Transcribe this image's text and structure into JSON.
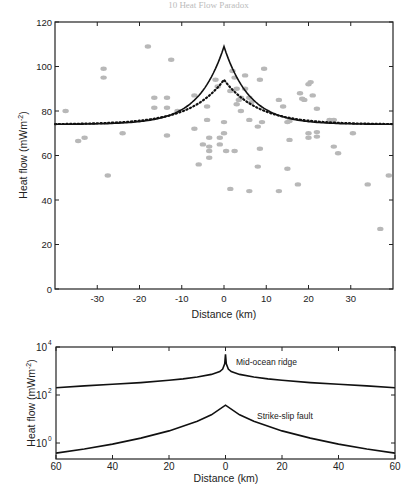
{
  "page": {
    "header": "10  Heat Flow Paradox"
  },
  "chart_data": [
    {
      "type": "scatter",
      "title": "",
      "xlabel": "Distance (km)",
      "ylabel": "Heat flow (mWm⁻²)",
      "xlim": [
        -40,
        40
      ],
      "ylim": [
        0,
        120
      ],
      "xticks": [
        -30,
        -20,
        -10,
        0,
        10,
        20,
        30
      ],
      "yticks": [
        0,
        20,
        40,
        60,
        80,
        100,
        120
      ],
      "grid": false,
      "legend": null,
      "series": [
        {
          "name": "Observed heat flow",
          "kind": "scatter",
          "color": "#b8b8b8",
          "points": [
            [
              -37.5,
              80
            ],
            [
              -34.5,
              66.5
            ],
            [
              -33,
              68
            ],
            [
              -28.5,
              99
            ],
            [
              -28.5,
              95
            ],
            [
              -27.5,
              51
            ],
            [
              -18,
              109
            ],
            [
              -12.5,
              103
            ],
            [
              -13.5,
              86
            ],
            [
              -13.5,
              81.5
            ],
            [
              -16.5,
              86
            ],
            [
              -16.5,
              81.5
            ],
            [
              -11,
              80
            ],
            [
              -13.5,
              69
            ],
            [
              -7,
              87
            ],
            [
              -4,
              82
            ],
            [
              -4,
              76
            ],
            [
              -3.5,
              68
            ],
            [
              -3.5,
              64
            ],
            [
              -3.5,
              62
            ],
            [
              -3.5,
              59
            ],
            [
              -5,
              65
            ],
            [
              -7,
              72
            ],
            [
              -6,
              56
            ],
            [
              -1,
              68
            ],
            [
              -1,
              65
            ],
            [
              -2,
              94
            ],
            [
              -1.5,
              91
            ],
            [
              1.5,
              89
            ],
            [
              2,
              98
            ],
            [
              2.5,
              95
            ],
            [
              3,
              90
            ],
            [
              3.5,
              85
            ],
            [
              4,
              80
            ],
            [
              3,
              83
            ],
            [
              4,
              86
            ],
            [
              5,
              90
            ],
            [
              5,
              96
            ],
            [
              6,
              86
            ],
            [
              6.5,
              84
            ],
            [
              0,
              75
            ],
            [
              0,
              70
            ],
            [
              0.5,
              62
            ],
            [
              2.5,
              62
            ],
            [
              1.5,
              45
            ],
            [
              6,
              76
            ],
            [
              6,
              44
            ],
            [
              8.5,
              94
            ],
            [
              9.5,
              99
            ],
            [
              9,
              75
            ],
            [
              8,
              73
            ],
            [
              8.5,
              63
            ],
            [
              8,
              55
            ],
            [
              13,
              85
            ],
            [
              14,
              82
            ],
            [
              15,
              75
            ],
            [
              15.5,
              75.5
            ],
            [
              15.5,
              67
            ],
            [
              15,
              54
            ],
            [
              18,
              88
            ],
            [
              19,
              85
            ],
            [
              20,
              92
            ],
            [
              20.5,
              93
            ],
            [
              21,
              87
            ],
            [
              22,
              81
            ],
            [
              22,
              70.5
            ],
            [
              22,
              68.5
            ],
            [
              20,
              70
            ],
            [
              20,
              68
            ],
            [
              17.5,
              47
            ],
            [
              13,
              44
            ],
            [
              18.5,
              85.5
            ],
            [
              25,
              76
            ],
            [
              26,
              76
            ],
            [
              26,
              64
            ],
            [
              27,
              61
            ],
            [
              30.5,
              70
            ],
            [
              34,
              47
            ],
            [
              37,
              27
            ],
            [
              39,
              51
            ],
            [
              -24,
              70
            ]
          ]
        },
        {
          "name": "Model (solid)",
          "kind": "line",
          "style": "solid",
          "color": "#111111",
          "baseline": 74,
          "peak": 109,
          "decay_km": 6
        },
        {
          "name": "Model (dotted)",
          "kind": "line",
          "style": "dotted",
          "color": "#111111",
          "baseline": 74,
          "peak": 94,
          "decay_km": 8
        }
      ]
    },
    {
      "type": "line",
      "title": "",
      "xlabel": "Distance (km)",
      "ylabel": "Heat flow (mWm⁻²)",
      "yscale": "log",
      "xlim": [
        -60,
        60
      ],
      "ylim": [
        0.2,
        10000
      ],
      "xticks": [
        -60,
        -40,
        -20,
        0,
        20,
        40,
        60
      ],
      "xtick_labels": [
        "60",
        "40",
        "20",
        "0",
        "20",
        "40",
        "60"
      ],
      "yticks": [
        1,
        100,
        10000
      ],
      "ytick_labels": [
        "10",
        "10",
        "10"
      ],
      "ytick_exponents": [
        "0",
        "2",
        "4"
      ],
      "grid": false,
      "annotations": [
        {
          "text": "Mid-ocean ridge",
          "x": 4,
          "y": 2500
        },
        {
          "text": "Strike-slip fault",
          "x": 11.5,
          "y": 20
        }
      ],
      "series": [
        {
          "name": "Mid-ocean ridge",
          "color": "#111111",
          "x": [
            -60,
            -50,
            -40,
            -30,
            -20,
            -15,
            -10,
            -5,
            -2,
            -1,
            -0.3,
            0,
            0.3,
            1,
            2,
            5,
            10,
            15,
            20,
            30,
            40,
            50,
            60
          ],
          "y": [
            200,
            240,
            280,
            330,
            410,
            470,
            560,
            720,
            950,
            1200,
            2000,
            5000,
            2000,
            1200,
            950,
            720,
            560,
            470,
            410,
            330,
            280,
            240,
            200
          ]
        },
        {
          "name": "Strike-slip fault",
          "color": "#111111",
          "x": [
            -60,
            -50,
            -40,
            -30,
            -20,
            -10,
            -5,
            0,
            5,
            10,
            20,
            30,
            40,
            50,
            60
          ],
          "y": [
            0.38,
            0.56,
            0.9,
            1.6,
            3.2,
            8,
            15,
            38,
            15,
            8,
            3.2,
            1.6,
            0.9,
            0.56,
            0.38
          ]
        }
      ]
    }
  ],
  "labels": {
    "top_ylabel": "Heat flow (mWm",
    "top_ylabel_sup": "-2",
    "top_ylabel_end": ")",
    "top_xlabel": "Distance (km)",
    "bottom_ylabel": "Heat flow (mWm",
    "bottom_ylabel_sup": "-2",
    "bottom_ylabel_end": ")",
    "bottom_xlabel": "Distance (km)",
    "ridge_label": "Mid-ocean ridge",
    "fault_label": "Strike-slip fault"
  }
}
